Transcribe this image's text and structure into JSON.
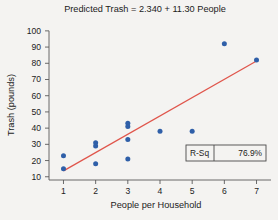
{
  "chart_data": {
    "type": "scatter",
    "title": "Predicted Trash = 2.340 + 11.30 People",
    "xlabel": "People per Household",
    "ylabel": "Trash (pounds)",
    "xlim": [
      0.55,
      7.45
    ],
    "ylim": [
      8,
      103
    ],
    "xticks": [
      1,
      2,
      3,
      4,
      5,
      6,
      7
    ],
    "xticklabels": [
      "1",
      "2",
      "3",
      "4",
      "5",
      "6",
      "7"
    ],
    "yticks": [
      10,
      20,
      30,
      40,
      50,
      60,
      70,
      80,
      90,
      100
    ],
    "yticklabels": [
      "10",
      "20",
      "30",
      "40",
      "50",
      "60",
      "70",
      "80",
      "90",
      "100"
    ],
    "grid": false,
    "legend_position": "inside-bottom-right",
    "point_color": "#2f5fa8",
    "line_color": "#e0554b",
    "background_color": "#f4f3f1",
    "axis_color": "#5a5a5a",
    "x": [
      1,
      1,
      2,
      2,
      2,
      3,
      3,
      3,
      3,
      4,
      5,
      6,
      7
    ],
    "y": [
      23,
      15,
      31,
      29,
      18,
      43,
      41,
      33,
      21,
      38,
      38,
      92,
      82
    ],
    "points": [
      {
        "x": 1,
        "y": 23
      },
      {
        "x": 1,
        "y": 15
      },
      {
        "x": 2,
        "y": 31
      },
      {
        "x": 2,
        "y": 29
      },
      {
        "x": 2,
        "y": 18
      },
      {
        "x": 3,
        "y": 43
      },
      {
        "x": 3,
        "y": 41
      },
      {
        "x": 3,
        "y": 33
      },
      {
        "x": 3,
        "y": 21
      },
      {
        "x": 4,
        "y": 38
      },
      {
        "x": 5,
        "y": 38
      },
      {
        "x": 6,
        "y": 92
      },
      {
        "x": 7,
        "y": 82
      }
    ],
    "fit": {
      "type": "linear",
      "intercept": 2.34,
      "slope": 11.3,
      "equation": "Predicted Trash = 2.340 + 11.30 People",
      "x_start": 1,
      "x_end": 7
    },
    "annotations": [
      {
        "name": "r-squared",
        "label": "R-Sq",
        "value": "76.9%"
      }
    ]
  },
  "legend": {
    "rsq_label": "R-Sq",
    "rsq_value": "76.9%"
  }
}
